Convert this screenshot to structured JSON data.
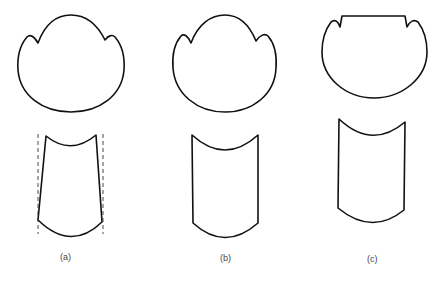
{
  "figure": {
    "panels": [
      {
        "id": "a",
        "label": "(a)",
        "top_shape": "circular-profile-with-two-lobes",
        "bottom_shape": "tapered-section-with-dashed-guides"
      },
      {
        "id": "b",
        "label": "(b)",
        "top_shape": "circular-profile-with-two-lobes",
        "bottom_shape": "straight-section"
      },
      {
        "id": "c",
        "label": "(c)",
        "top_shape": "circular-profile-with-flat-top-and-notches",
        "bottom_shape": "straight-section"
      }
    ],
    "colors": {
      "stroke": "#111111",
      "background": "#ffffff",
      "label": "#444444"
    }
  }
}
